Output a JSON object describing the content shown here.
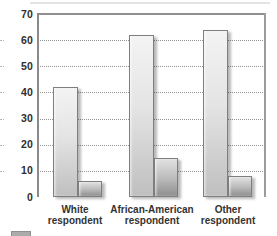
{
  "chart_data": {
    "type": "bar",
    "title": "",
    "xlabel": "",
    "ylabel": "",
    "categories": [
      "White respondent",
      "African-American respondent",
      "Other respondent"
    ],
    "category_label_lines": [
      [
        "White",
        "respondent"
      ],
      [
        "African-American",
        "respondent"
      ],
      [
        "Other",
        "respondent"
      ]
    ],
    "series": [
      {
        "name": "",
        "values": [
          42,
          62,
          64
        ]
      },
      {
        "name": "",
        "values": [
          6,
          15,
          8
        ]
      }
    ],
    "ylim": [
      0,
      70
    ],
    "yticks": [
      0,
      10,
      20,
      30,
      40,
      50,
      60,
      70
    ],
    "grid": "horizontal-dotted",
    "legend_position": "bottom-left, cut off at image edge"
  },
  "colors": {
    "background": "#ffffff",
    "bar_light_top": "#f3f3f3",
    "bar_light_bottom": "#bfbfbf",
    "bar_dark_top": "#e2e2e2",
    "bar_dark_bottom": "#8e8e8e",
    "bar_border": "#7e7e7e",
    "axis": "#8a8a8a",
    "grid": "#949494",
    "text": "#2e2e2e"
  }
}
